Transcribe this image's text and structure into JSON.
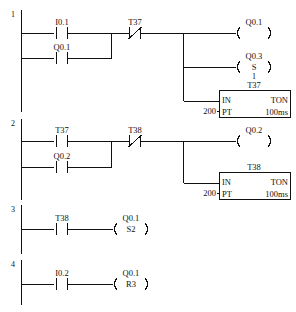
{
  "diagram": {
    "type": "ladder-logic"
  },
  "rungs": [
    {
      "number": "1",
      "contacts": [
        {
          "label": "I0.1",
          "kind": "NO"
        },
        {
          "label": "Q0.1",
          "kind": "NO"
        },
        {
          "label": "T37",
          "kind": "NC"
        }
      ],
      "outputs": [
        {
          "label": "Q0.1",
          "kind": "coil",
          "inner": ""
        },
        {
          "label": "Q0.3",
          "kind": "set-coil",
          "inner": "S",
          "below": "1"
        },
        {
          "label": "T37",
          "kind": "timer",
          "in": "IN",
          "type": "TON",
          "pt": "PT",
          "preset": "200",
          "timebase": "100ms"
        }
      ]
    },
    {
      "number": "2",
      "contacts": [
        {
          "label": "T37",
          "kind": "NO"
        },
        {
          "label": "Q0.2",
          "kind": "NO"
        },
        {
          "label": "T38",
          "kind": "NC"
        }
      ],
      "outputs": [
        {
          "label": "Q0.2",
          "kind": "coil",
          "inner": ""
        },
        {
          "label": "T38",
          "kind": "timer",
          "in": "IN",
          "type": "TON",
          "pt": "PT",
          "preset": "200",
          "timebase": "100ms"
        }
      ]
    },
    {
      "number": "3",
      "contacts": [
        {
          "label": "T38",
          "kind": "NO"
        }
      ],
      "outputs": [
        {
          "label": "Q0.1",
          "kind": "set-coil",
          "inner": "S2"
        }
      ]
    },
    {
      "number": "4",
      "contacts": [
        {
          "label": "I0.2",
          "kind": "NO"
        }
      ],
      "outputs": [
        {
          "label": "Q0.1",
          "kind": "reset-coil",
          "inner": "R3"
        }
      ]
    }
  ]
}
